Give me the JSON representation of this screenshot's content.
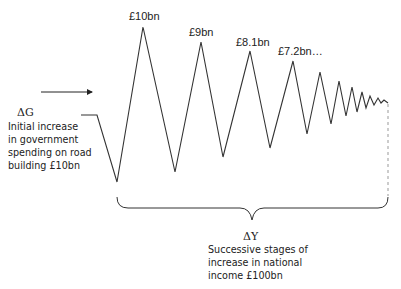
{
  "diagram": {
    "type": "multiplier-process",
    "left_annotation": {
      "symbol": "ΔG",
      "lines": [
        "Initial increase",
        "in government",
        "spending on road",
        "building £10bn"
      ]
    },
    "peak_labels": [
      "£10bn",
      "£9bn",
      "£8.1bn",
      "£7.2bn…"
    ],
    "bottom_annotation": {
      "symbol": "ΔY",
      "lines": [
        "Successive stages of",
        "increase in national",
        "income £100bn"
      ]
    },
    "colors": {
      "line": "#333333",
      "text": "#222222",
      "background": "#ffffff"
    }
  }
}
